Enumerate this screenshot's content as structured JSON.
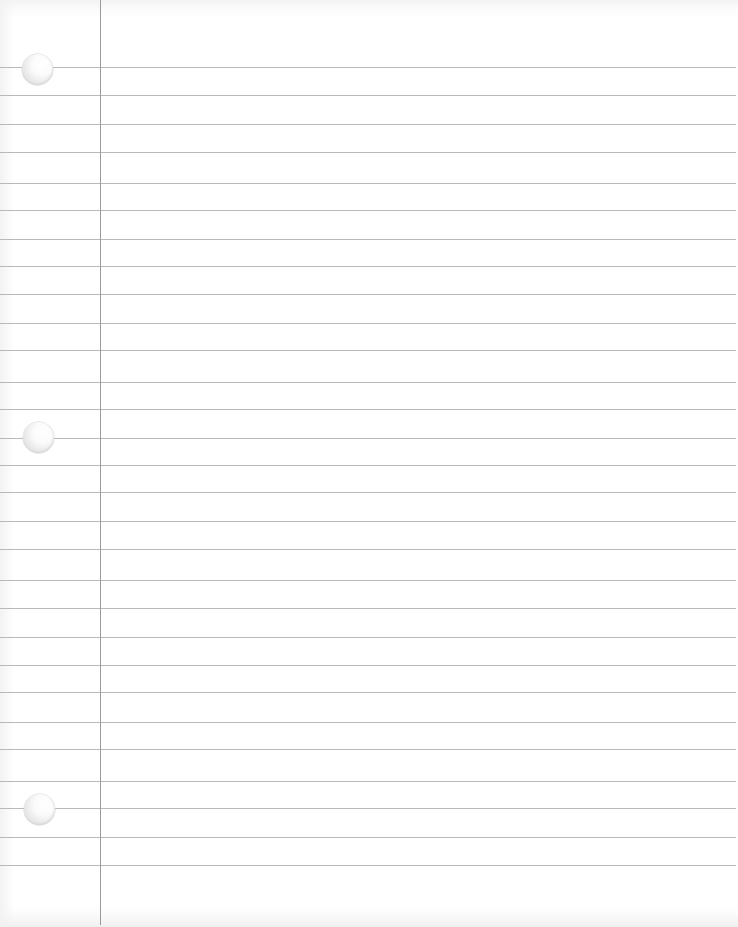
{
  "page": {
    "type": "lined-notebook-paper",
    "width": 738,
    "height": 927,
    "colors": {
      "paper": "#ffffff",
      "rule_line": "#b9b9b9",
      "margin_line": "#9a9a9a"
    },
    "margin_line_x": 100,
    "rule_lines_y": [
      67,
      95,
      124,
      152,
      183,
      210,
      239,
      266,
      294,
      323,
      350,
      382,
      409,
      438,
      465,
      492,
      521,
      549,
      580,
      608,
      637,
      665,
      692,
      722,
      749,
      781,
      808,
      837,
      865
    ],
    "binder_holes": [
      {
        "cx": 37,
        "cy": 69,
        "r": 15
      },
      {
        "cx": 38,
        "cy": 437,
        "r": 15
      },
      {
        "cx": 39,
        "cy": 809,
        "r": 15
      }
    ]
  }
}
